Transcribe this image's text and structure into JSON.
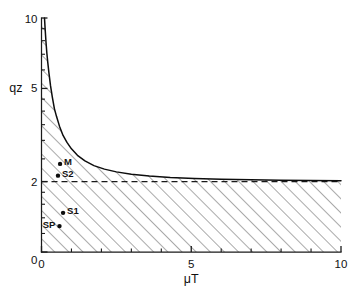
{
  "figure": {
    "background_color": "#ffffff",
    "ink_color": "#111111"
  },
  "axes": {
    "x": {
      "title": "μT",
      "min": 0,
      "max": 10,
      "scale": "linear",
      "tick_labels": [
        "0",
        "5",
        "10"
      ],
      "labeled_ticks": [
        0,
        5,
        10
      ],
      "minor_ticks": [
        1,
        2,
        3,
        4,
        6,
        7,
        8,
        9
      ]
    },
    "y": {
      "title": "qz",
      "min": 1,
      "max": 10,
      "scale": "log",
      "tick_labels": [
        "0",
        "2",
        "5",
        "10"
      ],
      "labeled_ticks": [
        1,
        2,
        5,
        10
      ],
      "minor_ticks": [
        1.2,
        1.4,
        1.6,
        1.8,
        2.5,
        3,
        3.5,
        4,
        4.5,
        6,
        7,
        8,
        9
      ]
    }
  },
  "chart_data": {
    "type": "line",
    "title": "",
    "xlabel": "μT",
    "ylabel": "qz",
    "xlim": [
      0,
      10
    ],
    "ylim": [
      1,
      10
    ],
    "yscale": "log",
    "xscale": "linear",
    "grid": false,
    "legend": "none",
    "series": [
      {
        "name": "stability boundary",
        "kind": "curve",
        "style": "solid",
        "note": "hyperbolic boundary, asymptotic to qz=2 and to the qz axis",
        "x": [
          0.1,
          0.12,
          0.15,
          0.18,
          0.21,
          0.25,
          0.3,
          0.36,
          0.43,
          0.5,
          0.6,
          0.72,
          0.85,
          1.0,
          1.2,
          1.45,
          1.75,
          2.1,
          2.5,
          3.0,
          3.6,
          4.3,
          5.1,
          6.0,
          7.0,
          8.0,
          9.0,
          10.0
        ],
        "y": [
          10.0,
          9.05,
          7.9,
          7.05,
          6.45,
          5.8,
          5.15,
          4.6,
          4.1,
          3.8,
          3.45,
          3.15,
          2.94,
          2.76,
          2.59,
          2.45,
          2.34,
          2.26,
          2.2,
          2.15,
          2.11,
          2.08,
          2.06,
          2.045,
          2.035,
          2.025,
          2.02,
          2.015
        ]
      },
      {
        "name": "asymptote",
        "kind": "horizontal-dashed-line",
        "style": "dashed",
        "y_value": 2,
        "x_range": [
          0,
          10
        ]
      }
    ],
    "hatched_region": {
      "description": "region below the boundary curve and below qz = 2",
      "hatch_angle_deg": 45,
      "hatch_color": "#4d4d4d"
    },
    "points": [
      {
        "label": "M",
        "x": 0.62,
        "y": 2.38,
        "label_side": "right"
      },
      {
        "label": "S2",
        "x": 0.55,
        "y": 2.12,
        "label_side": "right"
      },
      {
        "label": "S1",
        "x": 0.72,
        "y": 1.47,
        "label_side": "right"
      },
      {
        "label": "SP",
        "x": 0.6,
        "y": 1.29,
        "label_side": "left"
      }
    ]
  },
  "point_labels": {
    "m": "M",
    "s2": "S2",
    "s1": "S1",
    "sp": "SP"
  },
  "x_tick_labels": {
    "t0": "0",
    "t5": "5",
    "t10": "10"
  },
  "y_tick_labels": {
    "t0": "0",
    "t2": "2",
    "t5": "5",
    "t10": "10"
  }
}
